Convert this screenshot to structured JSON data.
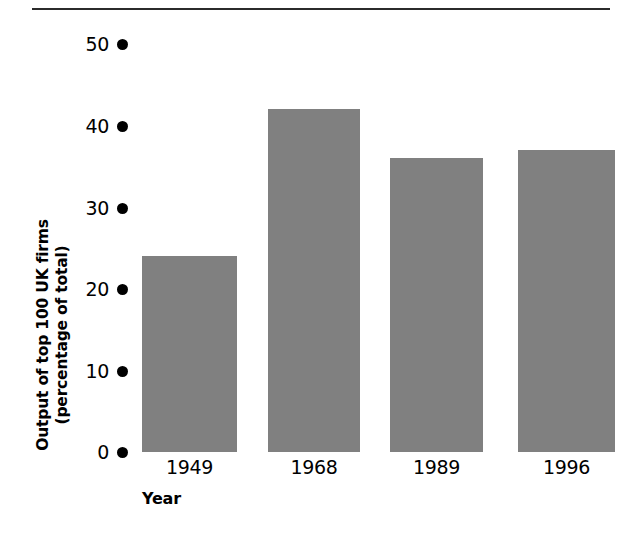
{
  "chart_data": {
    "type": "bar",
    "title": "",
    "subtitle": "",
    "categories": [
      "1949",
      "1968",
      "1989",
      "1996"
    ],
    "values": [
      24,
      42,
      36,
      37
    ],
    "xlabel": "Year",
    "ylabel_line1": "Output of top 100 UK firms",
    "ylabel_line2": "(percentage of total)",
    "ylabel": "Output of top 100 UK firms (percentage of total)",
    "ylim": [
      0,
      50
    ],
    "yticks": [
      50,
      40,
      30,
      20,
      10,
      0
    ],
    "ytick_labels": [
      "50",
      "40",
      "30",
      "20",
      "10",
      "0"
    ],
    "grid": false,
    "legend": null,
    "legend_position": "none",
    "bar_color": "#808080",
    "tick_marker_style": "filled-circle",
    "axis_spine": false,
    "top_rule": true,
    "text_color": "#000000",
    "background_color": "#ffffff"
  }
}
